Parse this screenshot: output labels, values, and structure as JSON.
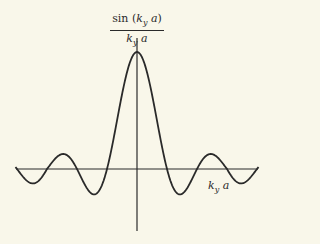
{
  "chart_data": {
    "type": "line",
    "title": "",
    "function": "sin(k_y a) / (k_y a)",
    "ylabel": {
      "numerator": "sin (k_y a)",
      "denominator": "k_y a"
    },
    "xlabel": "k_y a",
    "xlim": [
      -4.1,
      4.1
    ],
    "x_unit": "pi",
    "ylim": [
      -0.3,
      1.0
    ],
    "grid": false,
    "legend": null,
    "axes_style": "cross at origin, no ticks",
    "series": [
      {
        "name": "sinc",
        "x": [
          -4,
          -3.5,
          -3,
          -2.5,
          -2,
          -1.5,
          -1,
          -0.5,
          0,
          0.5,
          1,
          1.5,
          2,
          2.5,
          3,
          3.5,
          4
        ],
        "values": [
          0.0,
          -0.09,
          0.0,
          0.127,
          0.0,
          -0.212,
          0.0,
          0.637,
          1.0,
          0.637,
          0.0,
          -0.212,
          0.0,
          0.127,
          0.0,
          -0.09,
          0.0
        ]
      }
    ],
    "key_points": {
      "main_peak": {
        "x": 0,
        "y": 1.0
      },
      "zeros_at": [
        "±π",
        "±2π",
        "±3π",
        "±4π"
      ],
      "first_minimum": {
        "x": "±1.43π",
        "y": -0.217
      },
      "second_maximum": {
        "x": "±2.46π",
        "y": 0.128
      }
    }
  },
  "labels": {
    "y_num_pre": "sin (",
    "y_num_k": "k",
    "y_num_sub": "y",
    "y_num_a": " a",
    "y_num_post": ")",
    "y_den_k": "k",
    "y_den_sub": "y",
    "y_den_a": " a",
    "x_k": "k",
    "x_sub": "y",
    "x_a": " a"
  },
  "style": {
    "background": "#f9f7ea",
    "ink": "#2a2a2a"
  }
}
